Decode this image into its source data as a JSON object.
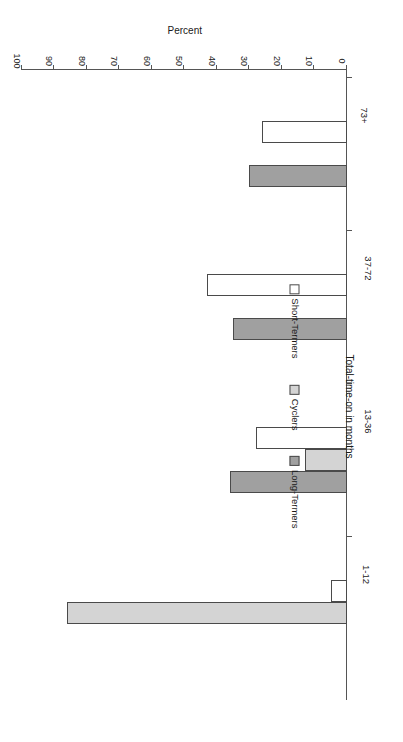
{
  "chart_data": {
    "type": "bar",
    "orientation": "horizontal",
    "title": "",
    "xlabel": "Total-time-on in months",
    "ylabel": "Percent",
    "categories": [
      "1-12",
      "13-36",
      "37-72",
      "73+"
    ],
    "ylim": [
      0,
      100
    ],
    "ytick_labels": [
      "0",
      "10",
      "20",
      "30",
      "40",
      "50",
      "60",
      "70",
      "80",
      "90",
      "100"
    ],
    "ytick_values": [
      0,
      10,
      20,
      30,
      40,
      50,
      60,
      70,
      80,
      90,
      100
    ],
    "grid": false,
    "legend_position": "bottom",
    "series": [
      {
        "name": "Long-Termers",
        "color": "#a0a0a0",
        "values": [
          0,
          36,
          35,
          30
        ]
      },
      {
        "name": "Cyclers",
        "color": "#d4d4d4",
        "values": [
          86,
          13,
          0,
          0
        ]
      },
      {
        "name": "Short-Termers",
        "color": "#ffffff",
        "values": [
          5,
          28,
          43,
          26
        ]
      }
    ]
  },
  "axis": {
    "value_axis_title": "Percent",
    "category_axis_title": "Total-time-on in months"
  }
}
